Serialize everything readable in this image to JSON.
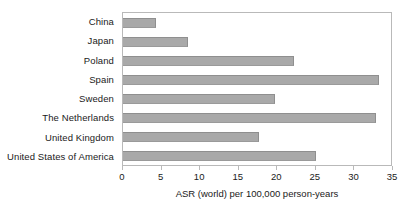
{
  "chart_data": {
    "type": "bar",
    "orientation": "horizontal",
    "title": "",
    "xlabel": "ASR (world) per 100,000 person-years",
    "ylabel": "",
    "categories": [
      "China",
      "Japan",
      "Poland",
      "Spain",
      "Sweden",
      "The Netherlands",
      "United Kingdom",
      "United States of America"
    ],
    "values": [
      4.3,
      8.4,
      22.2,
      33.2,
      19.7,
      32.8,
      17.6,
      25.0
    ],
    "xlim": [
      0,
      35
    ],
    "xticks": [
      0,
      5,
      10,
      15,
      20,
      25,
      30,
      35
    ],
    "xtick_labels": [
      "0",
      "5",
      "10",
      "15",
      "20",
      "25",
      "30",
      "35"
    ],
    "grid": false,
    "legend": null,
    "bar_color": "#a9a9a9",
    "frame_color": "#b9b9b9",
    "background_color": "#ffffff"
  }
}
